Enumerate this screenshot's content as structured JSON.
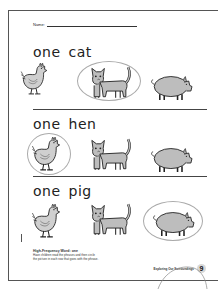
{
  "worksheet": {
    "name_label": "Name:",
    "rows": [
      {
        "phrase": "one cat",
        "circled": "cat"
      },
      {
        "phrase": "one hen",
        "circled": "hen"
      },
      {
        "phrase": "one pig",
        "circled": "pig"
      }
    ],
    "pictures": [
      "hen",
      "cat",
      "pig"
    ],
    "notes": {
      "title": "High-Frequency Word: one",
      "line1": "Have children read the phrases and then circle",
      "line2": "the picture in each row that goes with the phrase."
    },
    "footer": {
      "book_title": "Exploring Our Surroundings",
      "page_number": "9"
    }
  },
  "colors": {
    "animal_fill": "#bdbdbd",
    "outline": "#222222",
    "circle": "#aaaaaa"
  }
}
